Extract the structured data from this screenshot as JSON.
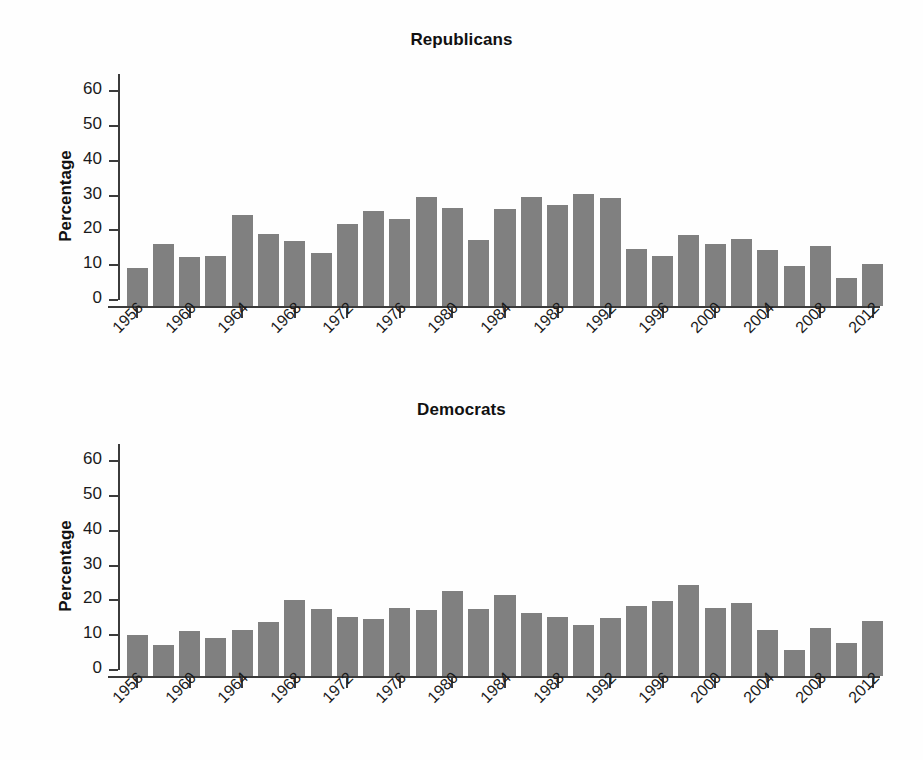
{
  "figure": {
    "bar_color": "#808080",
    "axis_color": "#3b3b3b",
    "background": "#fefefe"
  },
  "panels": [
    {
      "id": "republicans",
      "title": "Republicans",
      "ylabel": "Percentage"
    },
    {
      "id": "democrats",
      "title": "Democrats",
      "ylabel": "Percentage"
    }
  ],
  "chart_data": [
    {
      "type": "bar",
      "title": "Republicans",
      "xlabel": "",
      "ylabel": "Percentage",
      "ylim": [
        0,
        65
      ],
      "yticks": [
        0,
        10,
        20,
        30,
        40,
        50,
        60
      ],
      "ytick_labels": [
        "0",
        "10",
        "20",
        "30",
        "40",
        "50",
        "60"
      ],
      "xtick_labels": [
        "1956",
        "1960",
        "1964",
        "1968",
        "1972",
        "1976",
        "1980",
        "1984",
        "1988",
        "1992",
        "1996",
        "2000",
        "2004",
        "2008",
        "2012"
      ],
      "grid": false,
      "legend": null,
      "categories": [
        "1956",
        "1958",
        "1960",
        "1962",
        "1964",
        "1966",
        "1968",
        "1970",
        "1972",
        "1974",
        "1976",
        "1978",
        "1980",
        "1982",
        "1984",
        "1986",
        "1988",
        "1990",
        "1992",
        "1994",
        "1996",
        "1998",
        "2000",
        "2002",
        "2004",
        "2006",
        "2008",
        "2010",
        "2012"
      ],
      "values": [
        9.1,
        16.1,
        12.3,
        12.7,
        24.4,
        19.1,
        17.1,
        13.6,
        21.9,
        25.6,
        23.2,
        29.6,
        26.6,
        17.4,
        26.1,
        29.7,
        27.4,
        30.6,
        29.2,
        14.8,
        12.6,
        18.7,
        16.1,
        17.6,
        14.5,
        9.9,
        15.6,
        6.2,
        10.3
      ]
    },
    {
      "type": "bar",
      "title": "Democrats",
      "xlabel": "",
      "ylabel": "Percentage",
      "ylim": [
        0,
        65
      ],
      "yticks": [
        0,
        10,
        20,
        30,
        40,
        50,
        60
      ],
      "ytick_labels": [
        "0",
        "10",
        "20",
        "30",
        "40",
        "50",
        "60"
      ],
      "xtick_labels": [
        "1956",
        "1960",
        "1964",
        "1968",
        "1972",
        "1976",
        "1980",
        "1984",
        "1988",
        "1992",
        "1996",
        "2000",
        "2004",
        "2008",
        "2012"
      ],
      "grid": false,
      "legend": null,
      "categories": [
        "1956",
        "1958",
        "1960",
        "1962",
        "1964",
        "1966",
        "1968",
        "1970",
        "1972",
        "1974",
        "1976",
        "1978",
        "1980",
        "1982",
        "1984",
        "1986",
        "1988",
        "1990",
        "1992",
        "1994",
        "1996",
        "1998",
        "2000",
        "2002",
        "2004",
        "2006",
        "2008",
        "2010",
        "2012"
      ],
      "values": [
        10.2,
        7.1,
        11.1,
        9.2,
        11.6,
        13.8,
        20.2,
        17.5,
        15.3,
        14.7,
        17.7,
        17.4,
        22.6,
        17.6,
        21.6,
        16.5,
        15.2,
        12.9,
        14.9,
        18.4,
        19.8,
        24.4,
        17.9,
        19.2,
        11.4,
        5.8,
        12.0,
        7.8,
        14.0
      ]
    }
  ]
}
